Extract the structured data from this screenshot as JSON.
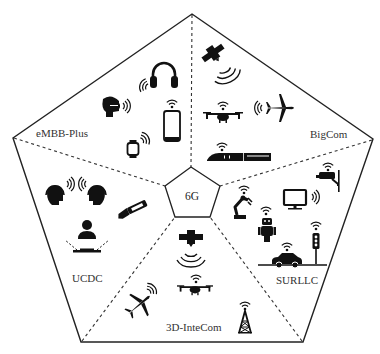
{
  "diagram": {
    "center": {
      "label": "6G"
    },
    "colors": {
      "stroke": "#222222",
      "icon": "#111111",
      "text": "#333333",
      "background": "#ffffff"
    },
    "segments": [
      {
        "id": "embb-plus",
        "label": "eMBB-Plus",
        "icons": [
          "headphones-icon",
          "vr-headset-icon",
          "smartphone-icon",
          "smartwatch-icon",
          "wireless-signal-icon"
        ]
      },
      {
        "id": "bigcom",
        "label": "BigCom",
        "icons": [
          "satellite-icon",
          "drone-icon",
          "airplane-icon",
          "high-speed-train-icon",
          "wireless-signal-icon"
        ]
      },
      {
        "id": "surllc",
        "label": "SURLLC",
        "icons": [
          "surveillance-camera-icon",
          "robot-arm-icon",
          "monitor-icon",
          "robot-icon",
          "traffic-light-icon",
          "car-icon",
          "wireless-signal-icon"
        ]
      },
      {
        "id": "3d-intecom",
        "label": "3D-InteCom",
        "icons": [
          "satellite-icon",
          "drone-icon",
          "airplane-icon",
          "cell-tower-icon",
          "wireless-signal-icon"
        ]
      },
      {
        "id": "ucdc",
        "label": "UCDC",
        "icons": [
          "holographic-head-icon",
          "holographic-head-icon",
          "haptic-hand-icon",
          "hologram-person-icon",
          "wireless-signal-icon"
        ]
      }
    ]
  }
}
